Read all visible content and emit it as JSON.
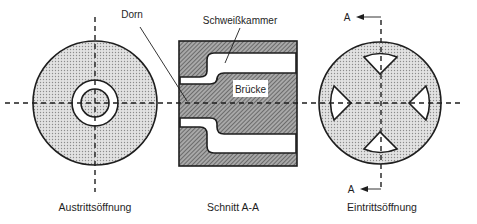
{
  "figure": {
    "views": {
      "exit": {
        "caption": "Austrittsöffnung"
      },
      "section": {
        "caption": "Schnitt A-A",
        "labels": {
          "weld_chamber": "Schweißkammer",
          "bridge": "Brücke",
          "mandrel": "Dorn"
        }
      },
      "entry": {
        "caption": "Eintrittsöffnung",
        "section_marker_top": "A",
        "section_marker_bottom": "A"
      }
    },
    "colors": {
      "line": "#1e1e1e",
      "dotted_fill": "#d6d6d6",
      "hatch_fill": "#8a8a8a",
      "background": "#ffffff"
    }
  }
}
